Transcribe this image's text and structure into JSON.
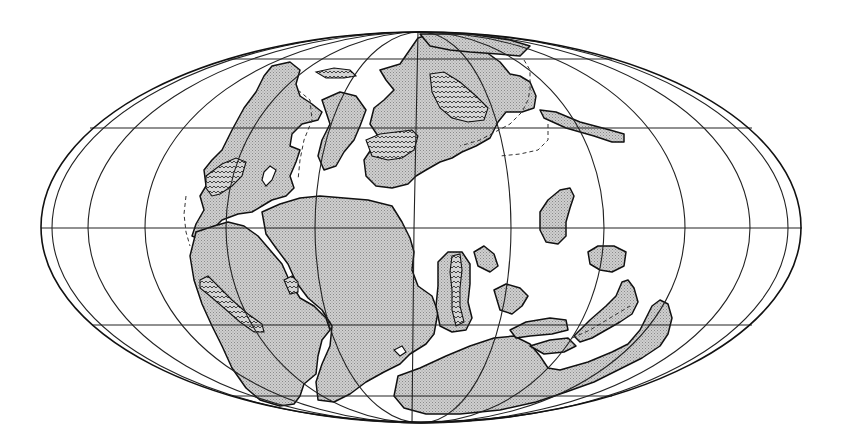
{
  "map": {
    "projection": "mollweide",
    "title": "",
    "colors": {
      "background": "#ffffff",
      "land_fill": "#c8c8c8",
      "land_stipple": "#9a9a9a",
      "outline": "#111111",
      "graticule": "#222222"
    },
    "frame": {
      "cx": 421,
      "cy": 228,
      "rx": 380,
      "ry": 195
    },
    "graticule": {
      "parallels_y": [
        59,
        128,
        228,
        325,
        396
      ],
      "meridians_equator_x": [
        41,
        52,
        88,
        145,
        226,
        315,
        414,
        511,
        604,
        685,
        750,
        788,
        802
      ]
    },
    "legend": {
      "land": "stippled grey — continental land",
      "zigzag": "wavy hatch — mountain / orogenic belt",
      "dashed": "dashed line — continental shelf margin"
    },
    "landmasses": [
      {
        "name": "laurasia-north-america"
      },
      {
        "name": "laurasia-eurasia"
      },
      {
        "name": "gondwana-south-america"
      },
      {
        "name": "gondwana-africa"
      },
      {
        "name": "gondwana-india-antarctica"
      },
      {
        "name": "gondwana-australia"
      },
      {
        "name": "island-arc-east"
      },
      {
        "name": "microcontinent-east-1"
      },
      {
        "name": "microcontinent-east-2"
      }
    ]
  }
}
